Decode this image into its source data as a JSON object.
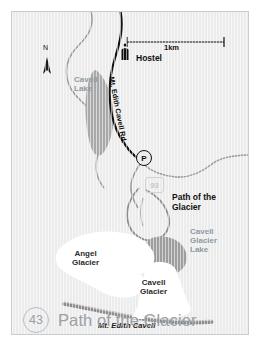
{
  "map": {
    "title": "Path of the Glacier",
    "route_badge": "43",
    "highway_shield": "93",
    "scale": {
      "label": "1km"
    },
    "compass": {
      "label": "N"
    },
    "parking": {
      "symbol": "P"
    },
    "labels": {
      "hostel": "Hostel",
      "cavell_lake": "Cavell\nLake",
      "road": "Mt. Edith Cavell Rd.",
      "path_of_the_glacier": "Path of the\nGlacier",
      "cavell_glacier_lake": "Cavell\nGlacier\nLake",
      "angel_glacier": "Angel\nGlacier",
      "cavell_glacier": "Cavell\nGlacier",
      "mt_edith_cavell": "Mt. Edith Cavell"
    },
    "icons": {
      "hostel": "hostel-marker-icon",
      "north": "north-arrow-icon",
      "parking": "parking-icon",
      "peak": "mountain-peak-icon"
    },
    "colors": {
      "background": "#ececec",
      "water": "#a6a6a6",
      "water_label": "#8e9aa4",
      "road": "#111111",
      "trail": "#8a8a8a",
      "glacier": "#ffffff",
      "ridge": "#8d8d8d",
      "title": "#9aa0a6",
      "frame": "#c9cdd1"
    }
  }
}
